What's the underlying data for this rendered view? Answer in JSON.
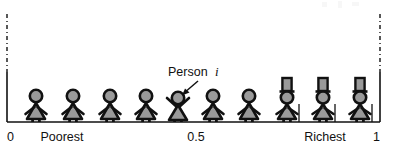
{
  "figure": {
    "background_color": "#ffffff",
    "ink_color": "#111111",
    "fill_color": "#9a9a9a"
  },
  "axis": {
    "name": "wealth-rank-axis",
    "orientation": "horizontal",
    "range_start": 0,
    "range_end": 1,
    "baseline_y": 122,
    "left_x": 7,
    "right_x": 380,
    "ticks": [
      {
        "id": "tick-0",
        "label": "0",
        "value": 0,
        "x": 7,
        "anchor": "start"
      },
      {
        "id": "tick-poorest",
        "label": "Poorest",
        "value": 0.15,
        "x": 62,
        "anchor": "middle"
      },
      {
        "id": "tick-half",
        "label": "0.5",
        "value": 0.5,
        "x": 196,
        "anchor": "middle"
      },
      {
        "id": "tick-richest",
        "label": "Richest",
        "value": 0.85,
        "x": 325,
        "anchor": "middle"
      },
      {
        "id": "tick-1",
        "label": "1",
        "value": 1,
        "x": 380,
        "anchor": "end"
      }
    ],
    "boundary_lines": [
      {
        "id": "left-boundary",
        "x": 7,
        "solid_from_y": 72,
        "solid_to_y": 122,
        "dashed_from_y": 14,
        "dashed_to_y": 72
      },
      {
        "id": "right-boundary",
        "x": 380,
        "solid_from_y": 72,
        "solid_to_y": 122,
        "dashed_from_y": 14,
        "dashed_to_y": 72
      }
    ]
  },
  "callout": {
    "name": "person-i-callout",
    "label_text": "Person",
    "label_symbol": "i",
    "label_x": 196,
    "label_y": 76,
    "arrow_from_x": 198,
    "arrow_from_y": 81,
    "arrow_to_x": 182,
    "arrow_to_y": 95
  },
  "people": [
    {
      "id": "person-1",
      "x": 36,
      "rank": 0.08,
      "type": "plain",
      "arms": "down",
      "hat": false,
      "cane": false
    },
    {
      "id": "person-2",
      "x": 73,
      "rank": 0.18,
      "type": "plain",
      "arms": "down",
      "hat": false,
      "cane": false
    },
    {
      "id": "person-3",
      "x": 110,
      "rank": 0.28,
      "type": "plain",
      "arms": "down",
      "hat": false,
      "cane": false
    },
    {
      "id": "person-4",
      "x": 146,
      "rank": 0.37,
      "type": "plain",
      "arms": "down",
      "hat": false,
      "cane": false
    },
    {
      "id": "person-5",
      "x": 178,
      "rank": 0.46,
      "type": "highlighted",
      "arms": "up",
      "hat": false,
      "cane": false
    },
    {
      "id": "person-6",
      "x": 213,
      "rank": 0.55,
      "type": "plain",
      "arms": "down",
      "hat": false,
      "cane": false
    },
    {
      "id": "person-7",
      "x": 249,
      "rank": 0.65,
      "type": "plain",
      "arms": "down",
      "hat": false,
      "cane": false
    },
    {
      "id": "person-8",
      "x": 287,
      "rank": 0.75,
      "type": "wealthy",
      "arms": "down",
      "hat": true,
      "cane": true
    },
    {
      "id": "person-9",
      "x": 323,
      "rank": 0.85,
      "type": "wealthy",
      "arms": "down",
      "hat": true,
      "cane": true
    },
    {
      "id": "person-10",
      "x": 360,
      "rank": 0.95,
      "type": "wealthy",
      "arms": "down",
      "hat": true,
      "cane": true
    }
  ],
  "artifacts": {
    "top_right_smudge": "faint cropped ink marks"
  }
}
